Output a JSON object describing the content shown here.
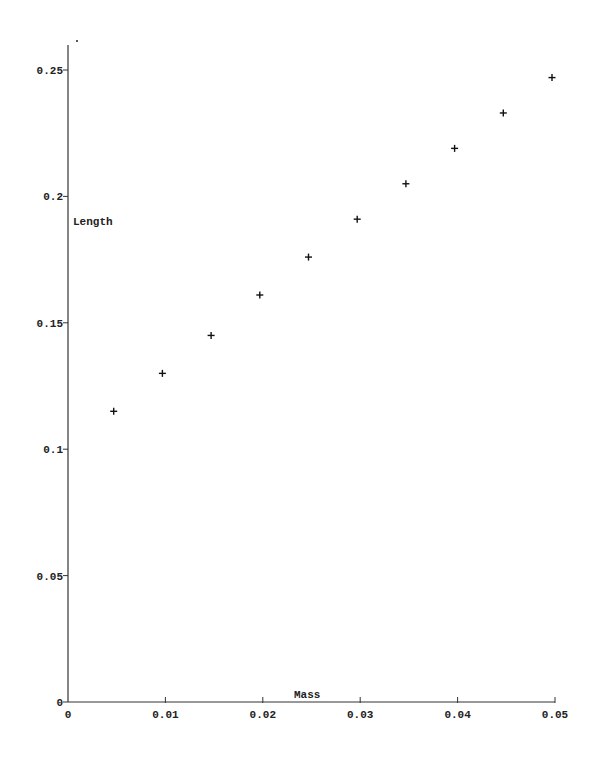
{
  "chart_data": {
    "type": "scatter",
    "title": "",
    "xlabel": "Mass",
    "ylabel": "Length",
    "xlim": [
      0,
      0.05
    ],
    "ylim": [
      0,
      0.26
    ],
    "grid": false,
    "legend": null,
    "marker": "+",
    "x_ticks": [
      0,
      0.01,
      0.02,
      0.03,
      0.04,
      0.05
    ],
    "x_tick_labels": [
      "0",
      "0.01",
      "0.02",
      "0.03",
      "0.04",
      "0.05"
    ],
    "y_ticks": [
      0,
      0.05,
      0.1,
      0.15,
      0.2,
      0.25
    ],
    "y_tick_labels": [
      "0",
      "0.05",
      "0.1",
      "0.15",
      "0.2",
      "0.25"
    ],
    "series": [
      {
        "name": "Length vs Mass",
        "x": [
          0.005,
          0.01,
          0.015,
          0.02,
          0.025,
          0.03,
          0.035,
          0.04,
          0.045,
          0.05
        ],
        "y": [
          0.115,
          0.13,
          0.145,
          0.161,
          0.176,
          0.191,
          0.205,
          0.219,
          0.233,
          0.247
        ]
      }
    ]
  },
  "colors": {
    "axis": "#333333",
    "marker": "#111111",
    "text": "#222222",
    "background": "#ffffff"
  }
}
